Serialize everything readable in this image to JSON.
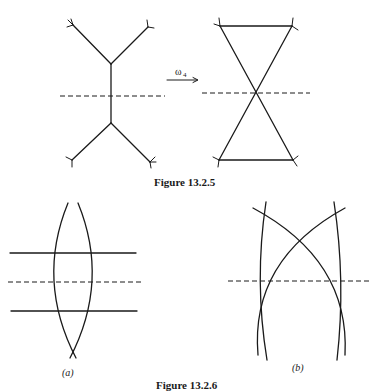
{
  "figure_13_2_5": {
    "caption": "Figure 13.2.5",
    "arrow_label": "ω",
    "arrow_subscript": "4"
  },
  "figure_13_2_6": {
    "caption": "Figure 13.2.6",
    "panel_a_label": "(a)",
    "panel_b_label": "(b)"
  },
  "colors": {
    "ink": "#1a1a1a",
    "background": "#ffffff"
  }
}
